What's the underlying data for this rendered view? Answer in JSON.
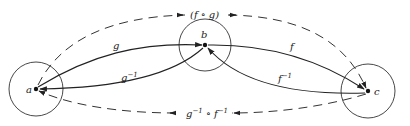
{
  "diagram": {
    "colors": {
      "ink": "#222222",
      "background": "#ffffff"
    },
    "nodes": [
      {
        "id": "a",
        "label": "a"
      },
      {
        "id": "b",
        "label": "b"
      },
      {
        "id": "c",
        "label": "c"
      }
    ],
    "edges": [
      {
        "id": "g",
        "from": "a",
        "to": "b",
        "label": "g",
        "style": "solid"
      },
      {
        "id": "g_inv",
        "from": "b",
        "to": "a",
        "label_base": "g",
        "label_sup": "−1",
        "style": "solid"
      },
      {
        "id": "f",
        "from": "b",
        "to": "c",
        "label": "f",
        "style": "solid"
      },
      {
        "id": "f_inv",
        "from": "c",
        "to": "b",
        "label_base": "f",
        "label_sup": "−1",
        "style": "solid"
      },
      {
        "id": "fog",
        "from": "a",
        "to": "c",
        "label": "(f ∘ g)",
        "style": "dashed"
      },
      {
        "id": "ginv_o_finv",
        "from": "c",
        "to": "a",
        "label_g": "g",
        "label_sup1": "−1",
        "label_op": " ∘ ",
        "label_f": "f",
        "label_sup2": "−1",
        "style": "dashed"
      }
    ]
  }
}
